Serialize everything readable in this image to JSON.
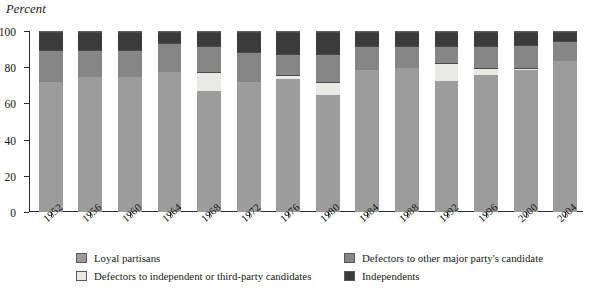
{
  "axis_title": "Percent",
  "chart_data": {
    "type": "bar",
    "subtype": "stacked-bar-100",
    "title": "",
    "xlabel": "",
    "ylabel": "Percent",
    "ylim": [
      0,
      100
    ],
    "yticks": [
      0,
      20,
      40,
      60,
      80,
      100
    ],
    "grid": false,
    "legend_position": "bottom",
    "categories": [
      "1952",
      "1956",
      "1960",
      "1964",
      "1968",
      "1972",
      "1976",
      "1980",
      "1984",
      "1988",
      "1992",
      "1996",
      "2000",
      "2004"
    ],
    "series": [
      {
        "name": "Loyal partisans",
        "color": "#9c9c9c",
        "values": [
          72,
          75,
          75,
          78,
          67,
          72,
          74,
          65,
          79,
          80,
          73,
          76,
          79,
          84
        ]
      },
      {
        "name": "Defectors to independent or third-party candidates",
        "color": "#e8e8e4",
        "values": [
          0,
          0,
          0,
          0,
          11,
          0,
          2,
          7,
          0,
          0,
          10,
          4,
          1,
          0
        ]
      },
      {
        "name": "Defectors to other major party's candidate",
        "color": "#868686",
        "values": [
          18,
          15,
          15,
          16,
          14,
          17,
          12,
          16,
          13,
          12,
          9,
          12,
          13,
          11
        ]
      },
      {
        "name": "Independents",
        "color": "#3b3b3b",
        "values": [
          10,
          10,
          10,
          6,
          8,
          11,
          12,
          12,
          8,
          8,
          8,
          8,
          7,
          5
        ]
      }
    ]
  },
  "legend": [
    {
      "label": "Loyal partisans",
      "color": "#9c9c9c"
    },
    {
      "label": "Defectors to independent or third-party candidates",
      "color": "#e8e8e4"
    },
    {
      "label": "Defectors to other major party's candidate",
      "color": "#868686"
    },
    {
      "label": "Independents",
      "color": "#3b3b3b"
    }
  ]
}
